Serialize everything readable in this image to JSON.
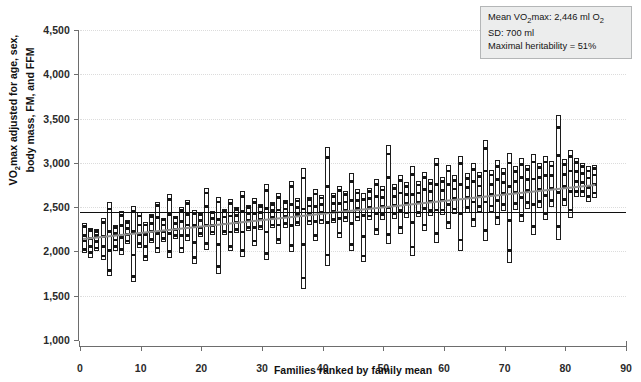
{
  "chart_data": {
    "type": "bar",
    "title": "",
    "xlabel": "Families ranked by family mean",
    "ylabel_line1": "VO2max adjusted for age, sex,",
    "ylabel_line2": "body mass, FM, and FFM",
    "ylabel_prefix": "VO",
    "ylabel_sub": "2",
    "ylabel_rest": "max adjusted for age, sex,",
    "xlim": [
      0,
      90
    ],
    "ylim": [
      1000,
      4500
    ],
    "yticks": [
      1000,
      1500,
      2000,
      2500,
      3000,
      3500,
      4000,
      4500
    ],
    "ytick_labels": [
      "1,000",
      "1,500",
      "2,000",
      "2,500",
      "3,000",
      "3,500",
      "4,000",
      "4,500"
    ],
    "xticks": [
      0,
      10,
      20,
      30,
      40,
      50,
      60,
      70,
      80,
      90
    ],
    "xtick_labels": [
      "0",
      "10",
      "20",
      "30",
      "40",
      "50",
      "60",
      "70",
      "80",
      "90"
    ],
    "grid": true,
    "legend_position": "none",
    "mean_line_value": 2446,
    "trend_line": {
      "x0": 0.5,
      "y0": 2150,
      "x1": 85,
      "y1": 2760
    },
    "series_note": "Each vertical open rectangle spans the min-max VO2max range of one family; small filled squares are individual family members.",
    "families": [
      {
        "x": 0.8,
        "low": 1980,
        "high": 2320,
        "members": [
          2020,
          2120,
          2180,
          2280
        ]
      },
      {
        "x": 1.8,
        "low": 1930,
        "high": 2270,
        "members": [
          1985,
          2060,
          2150,
          2240
        ]
      },
      {
        "x": 2.8,
        "low": 2000,
        "high": 2250,
        "members": [
          2040,
          2110,
          2180,
          2230
        ]
      },
      {
        "x": 3.8,
        "low": 1900,
        "high": 2380,
        "members": [
          1950,
          2060,
          2170,
          2330
        ]
      },
      {
        "x": 4.8,
        "low": 1720,
        "high": 2560,
        "members": [
          1790,
          2010,
          2230,
          2480
        ]
      },
      {
        "x": 5.8,
        "low": 2010,
        "high": 2300,
        "members": [
          2055,
          2130,
          2205,
          2275
        ]
      },
      {
        "x": 6.8,
        "low": 1960,
        "high": 2460,
        "members": [
          2020,
          2160,
          2290,
          2410
        ]
      },
      {
        "x": 7.8,
        "low": 2080,
        "high": 2350,
        "members": [
          2120,
          2190,
          2260,
          2330
        ]
      },
      {
        "x": 8.8,
        "low": 1650,
        "high": 2510,
        "members": [
          1720,
          1960,
          2230,
          2450
        ]
      },
      {
        "x": 9.8,
        "low": 2040,
        "high": 2440,
        "members": [
          2090,
          2190,
          2300,
          2400
        ]
      },
      {
        "x": 10.8,
        "low": 1890,
        "high": 2330,
        "members": [
          1940,
          2060,
          2190,
          2300
        ]
      },
      {
        "x": 11.8,
        "low": 2090,
        "high": 2420,
        "members": [
          2140,
          2230,
          2320,
          2395
        ]
      },
      {
        "x": 12.8,
        "low": 1980,
        "high": 2560,
        "members": [
          2040,
          2200,
          2380,
          2520
        ]
      },
      {
        "x": 13.8,
        "low": 2110,
        "high": 2380,
        "members": [
          2150,
          2225,
          2300,
          2360
        ]
      },
      {
        "x": 14.8,
        "low": 1930,
        "high": 2650,
        "members": [
          2000,
          2200,
          2420,
          2590
        ]
      },
      {
        "x": 15.8,
        "low": 2140,
        "high": 2400,
        "members": [
          2180,
          2250,
          2320,
          2380
        ]
      },
      {
        "x": 16.8,
        "low": 1980,
        "high": 2500,
        "members": [
          2040,
          2180,
          2340,
          2460
        ]
      },
      {
        "x": 17.8,
        "low": 2120,
        "high": 2580,
        "members": [
          2180,
          2300,
          2420,
          2540
        ]
      },
      {
        "x": 18.8,
        "low": 1860,
        "high": 2470,
        "members": [
          1930,
          2100,
          2290,
          2430
        ]
      },
      {
        "x": 19.8,
        "low": 2160,
        "high": 2440,
        "members": [
          2200,
          2275,
          2350,
          2415
        ]
      },
      {
        "x": 20.8,
        "low": 2020,
        "high": 2720,
        "members": [
          2090,
          2290,
          2510,
          2660
        ]
      },
      {
        "x": 21.8,
        "low": 2180,
        "high": 2460,
        "members": [
          2220,
          2295,
          2370,
          2435
        ]
      },
      {
        "x": 22.8,
        "low": 1750,
        "high": 2620,
        "members": [
          1830,
          2080,
          2360,
          2560
        ]
      },
      {
        "x": 23.8,
        "low": 2190,
        "high": 2480,
        "members": [
          2230,
          2310,
          2390,
          2455
        ]
      },
      {
        "x": 24.8,
        "low": 2000,
        "high": 2590,
        "members": [
          2060,
          2220,
          2400,
          2540
        ]
      },
      {
        "x": 25.8,
        "low": 2210,
        "high": 2500,
        "members": [
          2250,
          2330,
          2410,
          2475
        ]
      },
      {
        "x": 26.8,
        "low": 1940,
        "high": 2680,
        "members": [
          2010,
          2220,
          2450,
          2620
        ]
      },
      {
        "x": 27.8,
        "low": 2230,
        "high": 2520,
        "members": [
          2270,
          2350,
          2430,
          2495
        ]
      },
      {
        "x": 28.8,
        "low": 2060,
        "high": 2600,
        "members": [
          2120,
          2270,
          2430,
          2555
        ]
      },
      {
        "x": 29.8,
        "low": 2240,
        "high": 2540,
        "members": [
          2285,
          2365,
          2445,
          2510
        ]
      },
      {
        "x": 30.8,
        "low": 1900,
        "high": 2760,
        "members": [
          1980,
          2220,
          2490,
          2690
        ]
      },
      {
        "x": 31.8,
        "low": 2260,
        "high": 2560,
        "members": [
          2300,
          2380,
          2460,
          2530
        ]
      },
      {
        "x": 32.8,
        "low": 2080,
        "high": 2660,
        "members": [
          2140,
          2300,
          2470,
          2610
        ]
      },
      {
        "x": 33.8,
        "low": 2270,
        "high": 2580,
        "members": [
          2315,
          2400,
          2480,
          2550
        ]
      },
      {
        "x": 34.8,
        "low": 1990,
        "high": 2800,
        "members": [
          2070,
          2290,
          2530,
          2730
        ]
      },
      {
        "x": 35.8,
        "low": 2290,
        "high": 2600,
        "members": [
          2330,
          2415,
          2500,
          2570
        ]
      },
      {
        "x": 36.8,
        "low": 1580,
        "high": 2940,
        "members": [
          1700,
          2080,
          2480,
          2830
        ]
      },
      {
        "x": 37.8,
        "low": 2300,
        "high": 2620,
        "members": [
          2345,
          2430,
          2515,
          2590
        ]
      },
      {
        "x": 38.8,
        "low": 2120,
        "high": 2700,
        "members": [
          2180,
          2340,
          2510,
          2650
        ]
      },
      {
        "x": 39.8,
        "low": 2310,
        "high": 2640,
        "members": [
          2355,
          2445,
          2530,
          2605
        ]
      },
      {
        "x": 40.8,
        "low": 1830,
        "high": 3180,
        "members": [
          1960,
          2330,
          2730,
          3060
        ]
      },
      {
        "x": 41.8,
        "low": 2320,
        "high": 2660,
        "members": [
          2365,
          2455,
          2545,
          2625
        ]
      },
      {
        "x": 42.8,
        "low": 2150,
        "high": 2740,
        "members": [
          2210,
          2375,
          2545,
          2690
        ]
      },
      {
        "x": 43.8,
        "low": 2330,
        "high": 2680,
        "members": [
          2380,
          2470,
          2560,
          2640
        ]
      },
      {
        "x": 44.8,
        "low": 2000,
        "high": 2880,
        "members": [
          2080,
          2320,
          2580,
          2790
        ]
      },
      {
        "x": 45.8,
        "low": 2340,
        "high": 2700,
        "members": [
          2390,
          2485,
          2580,
          2660
        ]
      },
      {
        "x": 46.8,
        "low": 1880,
        "high": 2660,
        "members": [
          1950,
          2170,
          2410,
          2590
        ]
      },
      {
        "x": 47.8,
        "low": 2350,
        "high": 2720,
        "members": [
          2400,
          2495,
          2595,
          2680
        ]
      },
      {
        "x": 48.8,
        "low": 2180,
        "high": 2820,
        "members": [
          2250,
          2430,
          2620,
          2760
        ]
      },
      {
        "x": 49.8,
        "low": 2360,
        "high": 2740,
        "members": [
          2415,
          2510,
          2610,
          2695
        ]
      },
      {
        "x": 50.8,
        "low": 2080,
        "high": 3200,
        "members": [
          2190,
          2500,
          2840,
          3100
        ]
      },
      {
        "x": 51.8,
        "low": 2370,
        "high": 2760,
        "members": [
          2425,
          2525,
          2625,
          2715
        ]
      },
      {
        "x": 52.8,
        "low": 2200,
        "high": 2860,
        "members": [
          2270,
          2460,
          2660,
          2800
        ]
      },
      {
        "x": 53.8,
        "low": 2380,
        "high": 2780,
        "members": [
          2435,
          2540,
          2640,
          2730
        ]
      },
      {
        "x": 54.8,
        "low": 1950,
        "high": 2960,
        "members": [
          2050,
          2330,
          2640,
          2870
        ]
      },
      {
        "x": 55.8,
        "low": 2390,
        "high": 2800,
        "members": [
          2445,
          2550,
          2660,
          2750
        ]
      },
      {
        "x": 56.8,
        "low": 2230,
        "high": 2900,
        "members": [
          2300,
          2490,
          2700,
          2840
        ]
      },
      {
        "x": 57.8,
        "low": 2400,
        "high": 2820,
        "members": [
          2460,
          2565,
          2675,
          2770
        ]
      },
      {
        "x": 58.8,
        "low": 2100,
        "high": 3060,
        "members": [
          2200,
          2470,
          2760,
          2980
        ]
      },
      {
        "x": 59.8,
        "low": 2410,
        "high": 2840,
        "members": [
          2470,
          2580,
          2690,
          2790
        ]
      },
      {
        "x": 60.8,
        "low": 2250,
        "high": 2980,
        "members": [
          2330,
          2530,
          2760,
          2910
        ]
      },
      {
        "x": 61.8,
        "low": 2420,
        "high": 2860,
        "members": [
          2480,
          2595,
          2705,
          2805
        ]
      },
      {
        "x": 62.8,
        "low": 2010,
        "high": 3080,
        "members": [
          2130,
          2430,
          2760,
          2990
        ]
      },
      {
        "x": 63.8,
        "low": 2430,
        "high": 2880,
        "members": [
          2495,
          2610,
          2725,
          2825
        ]
      },
      {
        "x": 64.8,
        "low": 2280,
        "high": 3000,
        "members": [
          2360,
          2560,
          2790,
          2930
        ]
      },
      {
        "x": 65.8,
        "low": 2440,
        "high": 2900,
        "members": [
          2505,
          2625,
          2740,
          2845
        ]
      },
      {
        "x": 66.8,
        "low": 2120,
        "high": 3260,
        "members": [
          2240,
          2560,
          2910,
          3160
        ]
      },
      {
        "x": 67.8,
        "low": 2450,
        "high": 2920,
        "members": [
          2515,
          2640,
          2760,
          2865
        ]
      },
      {
        "x": 68.8,
        "low": 2300,
        "high": 3030,
        "members": [
          2380,
          2580,
          2810,
          2960
        ]
      },
      {
        "x": 69.8,
        "low": 2460,
        "high": 2940,
        "members": [
          2530,
          2655,
          2780,
          2885
        ]
      },
      {
        "x": 70.8,
        "low": 1870,
        "high": 3110,
        "members": [
          2010,
          2350,
          2730,
          3000
        ]
      },
      {
        "x": 71.8,
        "low": 2470,
        "high": 2960,
        "members": [
          2540,
          2670,
          2795,
          2905
        ]
      },
      {
        "x": 72.8,
        "low": 2330,
        "high": 3050,
        "members": [
          2410,
          2610,
          2840,
          2980
        ]
      },
      {
        "x": 73.8,
        "low": 2480,
        "high": 2980,
        "members": [
          2550,
          2685,
          2815,
          2925
        ]
      },
      {
        "x": 74.8,
        "low": 2180,
        "high": 3100,
        "members": [
          2280,
          2530,
          2820,
          3010
        ]
      },
      {
        "x": 75.8,
        "low": 2490,
        "high": 3000,
        "members": [
          2565,
          2700,
          2835,
          2945
        ]
      },
      {
        "x": 76.8,
        "low": 2350,
        "high": 3080,
        "members": [
          2430,
          2630,
          2860,
          3010
        ]
      },
      {
        "x": 77.8,
        "low": 2500,
        "high": 3020,
        "members": [
          2575,
          2715,
          2855,
          2965
        ]
      },
      {
        "x": 78.8,
        "low": 2130,
        "high": 3540,
        "members": [
          2280,
          2670,
          3080,
          3400
        ]
      },
      {
        "x": 79.8,
        "low": 2510,
        "high": 3040,
        "members": [
          2585,
          2730,
          2870,
          2985
        ]
      },
      {
        "x": 80.8,
        "low": 2380,
        "high": 3150,
        "members": [
          2470,
          2680,
          2910,
          3070
        ]
      },
      {
        "x": 81.8,
        "low": 2610,
        "high": 3060,
        "members": [
          2675,
          2790,
          2905,
          3005
        ]
      },
      {
        "x": 82.8,
        "low": 2620,
        "high": 3000,
        "members": [
          2680,
          2780,
          2880,
          2960
        ]
      },
      {
        "x": 83.8,
        "low": 2560,
        "high": 2960,
        "members": [
          2620,
          2725,
          2830,
          2910
        ]
      },
      {
        "x": 84.8,
        "low": 2600,
        "high": 2980,
        "members": [
          2660,
          2760,
          2865,
          2940
        ]
      }
    ]
  },
  "annotation": {
    "line1_pre": "Mean VO",
    "line1_sub": "2",
    "line1_mid": "max: 2,446 ml O",
    "line1_sub2": "2",
    "line2": "SD: 700 ml",
    "line3": "Maximal heritability = 51%"
  },
  "colors": {
    "axis": "#6d6d6d",
    "grid": "#dcdcdc",
    "bar_border": "#1c1c1c",
    "point": "#151515",
    "mean_line": "#101010",
    "trend_line": "#8e8e8e",
    "annot_bg": "#eceded",
    "annot_border": "#b4b6b7"
  }
}
